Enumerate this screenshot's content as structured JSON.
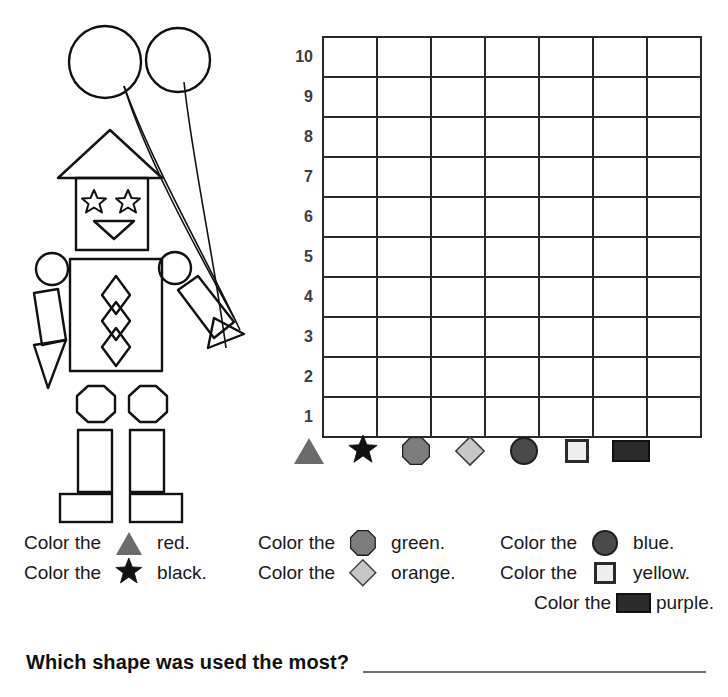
{
  "worksheet": {
    "grid": {
      "columns": 7,
      "rows": 10,
      "row_labels": [
        "10",
        "9",
        "8",
        "7",
        "6",
        "5",
        "4",
        "3",
        "2",
        "1"
      ],
      "cell_values": [
        [
          "",
          "",
          "",
          "",
          "",
          "",
          ""
        ],
        [
          "",
          "",
          "",
          "",
          "",
          "",
          ""
        ],
        [
          "",
          "",
          "",
          "",
          "",
          "",
          ""
        ],
        [
          "",
          "",
          "",
          "",
          "",
          "",
          ""
        ],
        [
          "",
          "",
          "",
          "",
          "",
          "",
          ""
        ],
        [
          "",
          "",
          "",
          "",
          "",
          "",
          ""
        ],
        [
          "",
          "",
          "",
          "",
          "",
          "",
          ""
        ],
        [
          "",
          "",
          "",
          "",
          "",
          "",
          ""
        ],
        [
          "",
          "",
          "",
          "",
          "",
          "",
          ""
        ],
        [
          "",
          "",
          "",
          "",
          "",
          "",
          ""
        ]
      ]
    },
    "shape_key": [
      {
        "shape": "triangle",
        "icon": "triangle-icon",
        "fill": "#6b6b6b",
        "stroke": "#6b6b6b"
      },
      {
        "shape": "star",
        "icon": "star-icon",
        "fill": "#111111",
        "stroke": "#111111"
      },
      {
        "shape": "octagon",
        "icon": "octagon-icon",
        "fill": "#7d7d7d",
        "stroke": "#1f1f1f"
      },
      {
        "shape": "diamond",
        "icon": "diamond-icon",
        "fill": "#c6c6c6",
        "stroke": "#3a3a3a"
      },
      {
        "shape": "circle",
        "icon": "circle-icon",
        "fill": "#4a4a4a",
        "stroke": "#1f1f1f"
      },
      {
        "shape": "square",
        "icon": "square-icon",
        "fill": "#eeeeee",
        "stroke": "#2a2a2a"
      },
      {
        "shape": "rectangle",
        "icon": "rectangle-icon",
        "fill": "#2b2b2b",
        "stroke": "#111111"
      }
    ],
    "color_instructions": {
      "lead_text": "Color the",
      "column_1": [
        {
          "shape": "triangle",
          "color_word": "red."
        },
        {
          "shape": "star",
          "color_word": "black."
        }
      ],
      "column_2": [
        {
          "shape": "octagon",
          "color_word": "green."
        },
        {
          "shape": "diamond",
          "color_word": "orange."
        }
      ],
      "column_3": [
        {
          "shape": "circle",
          "color_word": "blue."
        },
        {
          "shape": "square",
          "color_word": "yellow."
        },
        {
          "shape": "rectangle",
          "color_word": "purple."
        }
      ]
    },
    "question": {
      "text": "Which shape was used the most?",
      "answer": ""
    },
    "illustration": {
      "name": "robot-with-balloons",
      "parts": [
        "balloon-left-circle",
        "balloon-right-circle",
        "balloon-strings",
        "hat-triangle",
        "head-square",
        "eye-star-left",
        "eye-star-right",
        "mouth-triangle",
        "shoulder-circle-left",
        "shoulder-circle-right",
        "arm-rectangle-left",
        "hand-triangle-left",
        "arm-rectangle-right",
        "hand-triangle-right",
        "torso-square",
        "chest-diamond-1",
        "chest-diamond-2",
        "chest-diamond-3",
        "knee-octagon-left",
        "knee-octagon-right",
        "leg-rectangle-left",
        "leg-rectangle-right",
        "foot-rectangle-left",
        "foot-rectangle-right"
      ]
    }
  }
}
